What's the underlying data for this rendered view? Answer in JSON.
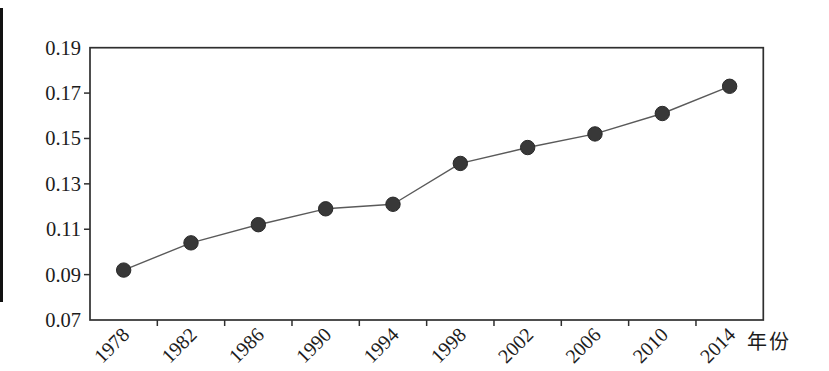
{
  "figure": {
    "background": "#ffffff",
    "scan_edge_color": "#111111"
  },
  "chart_data": {
    "type": "line",
    "title": "",
    "xlabel": "年份",
    "ylabel": "",
    "categories": [
      "1978",
      "1982",
      "1986",
      "1990",
      "1994",
      "1998",
      "2002",
      "2006",
      "2010",
      "2014"
    ],
    "series": [
      {
        "name": "",
        "values": [
          0.092,
          0.104,
          0.112,
          0.119,
          0.121,
          0.139,
          0.146,
          0.152,
          0.161,
          0.173
        ]
      }
    ],
    "ylim": [
      0.07,
      0.19
    ],
    "y_ticks": [
      0.19,
      0.17,
      0.15,
      0.13,
      0.11,
      0.09,
      0.07
    ],
    "y_tick_labels": [
      "0.19",
      "0.17",
      "0.15",
      "0.13",
      "0.11",
      "0.09",
      "0.07"
    ],
    "grid": false,
    "legend": "none",
    "marker": "circle",
    "x_label_rotation_deg": -45,
    "line_color": "#5a5a5a",
    "marker_color": "#383838",
    "axis_color": "#2f2f2f",
    "label_color": "#1c1c1c"
  }
}
